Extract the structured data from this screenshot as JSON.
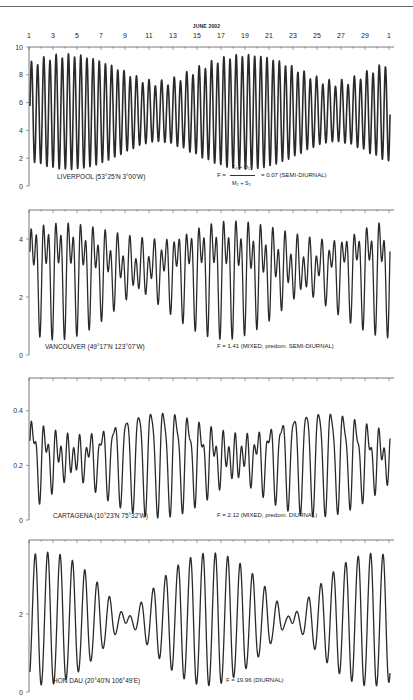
{
  "chart_data": {
    "type": "line",
    "title": "JUNE 2002",
    "x_axis": {
      "tick_labels": [
        "1",
        "3",
        "5",
        "7",
        "9",
        "11",
        "13",
        "15",
        "17",
        "19",
        "21",
        "23",
        "25",
        "27",
        "29",
        "1"
      ],
      "range_days": [
        0,
        30
      ]
    },
    "formula": {
      "lhs": "F =",
      "numerator": "K₁ + O₁",
      "denominator": "M₂ + S₂"
    },
    "panels": [
      {
        "station": "LIVERPOOL (53°25'N   3°00'W)",
        "form_factor": "= 0.07  (SEMI-DIURNAL)",
        "y_ticks": [
          "0",
          "2",
          "4",
          "6",
          "8",
          "10"
        ],
        "ylim": [
          0,
          10
        ],
        "mean": 5.3,
        "constituents": [
          {
            "name": "M2",
            "amp": 3.1,
            "period_h": 12.42,
            "phase": 1.2
          },
          {
            "name": "S2",
            "amp": 1.0,
            "period_h": 12.0,
            "phase": 2.6
          },
          {
            "name": "K1",
            "amp": 0.12,
            "period_h": 23.93,
            "phase": 0.3
          },
          {
            "name": "O1",
            "amp": 0.11,
            "period_h": 25.82,
            "phase": 0.8
          }
        ],
        "approx_high_water_range": [
          6.8,
          9.1
        ],
        "approx_low_water_range": [
          1.2,
          3.3
        ]
      },
      {
        "station": "VANCOUVER (49°17'N   123°07'W)",
        "form_factor": "F  =  1.41  (MIXED, predom. SEMI-DIURNAL)",
        "y_ticks": [
          "0",
          "2",
          "4"
        ],
        "ylim": [
          0,
          5
        ],
        "mean": 3.0,
        "constituents": [
          {
            "name": "M2",
            "amp": 0.92,
            "period_h": 12.42,
            "phase": 0.5
          },
          {
            "name": "S2",
            "amp": 0.23,
            "period_h": 12.0,
            "phase": 1.4
          },
          {
            "name": "K1",
            "amp": 0.86,
            "period_h": 23.93,
            "phase": 2.2
          },
          {
            "name": "O1",
            "amp": 0.49,
            "period_h": 25.82,
            "phase": 1.1
          }
        ],
        "approx_high_water_range": [
          3.3,
          4.8
        ],
        "approx_low_water_range": [
          0.4,
          2.6
        ]
      },
      {
        "station": "CARTAGENA (10°23'N   75°32'W)",
        "form_factor": "F  =  2.12  (MIXED, predom. DIURNAL)",
        "y_ticks": [
          "0",
          "0.2",
          "0.4"
        ],
        "ylim": [
          0,
          0.52
        ],
        "mean": 0.23,
        "constituents": [
          {
            "name": "M2",
            "amp": 0.05,
            "period_h": 12.42,
            "phase": 0.4
          },
          {
            "name": "S2",
            "amp": 0.015,
            "period_h": 12.0,
            "phase": 1.0
          },
          {
            "name": "K1",
            "amp": 0.105,
            "period_h": 23.93,
            "phase": 0.9
          },
          {
            "name": "O1",
            "amp": 0.08,
            "period_h": 25.82,
            "phase": 2.4
          }
        ],
        "approx_high_water_range": [
          0.25,
          0.49
        ],
        "approx_low_water_range": [
          0.04,
          0.14
        ]
      },
      {
        "station": "HON DAU (20°40'N   106°49'E)",
        "form_factor": "F  =  19.96  (DIURNAL)",
        "y_ticks": [
          "0",
          "2"
        ],
        "ylim": [
          0,
          3.9
        ],
        "mean": 1.85,
        "constituents": [
          {
            "name": "M2",
            "amp": 0.04,
            "period_h": 12.42,
            "phase": 0.0
          },
          {
            "name": "S2",
            "amp": 0.03,
            "period_h": 12.0,
            "phase": 0.5
          },
          {
            "name": "K1",
            "amp": 0.88,
            "period_h": 23.93,
            "phase": 2.9
          },
          {
            "name": "O1",
            "amp": 0.82,
            "period_h": 25.82,
            "phase": 2.3
          }
        ],
        "approx_high_water_range": [
          1.9,
          3.6
        ],
        "approx_low_water_range": [
          0.1,
          1.6
        ]
      }
    ]
  },
  "colors": {
    "curve": "#2a2a2a",
    "axis": "#555555",
    "text": "#222222"
  }
}
